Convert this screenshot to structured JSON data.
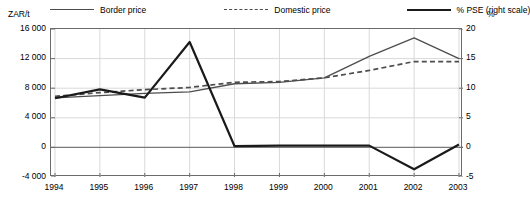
{
  "chart_data": {
    "type": "line",
    "title": "",
    "xlabel": "",
    "ylabel": "ZAR/t",
    "ylabel_right": "%",
    "x": [
      "1994",
      "1995",
      "1996",
      "1997",
      "1998",
      "1999",
      "2000",
      "2001",
      "2002",
      "2003"
    ],
    "categories": [
      "1994",
      "1995",
      "1996",
      "1997",
      "1998",
      "1999",
      "2000",
      "2001",
      "2002",
      "2003"
    ],
    "ylim": [
      -4000,
      16000
    ],
    "ylim_right": [
      -5,
      20
    ],
    "yticks": [
      "16 000",
      "12 000",
      "8 000",
      "4 000",
      "0",
      "-4 000"
    ],
    "ytick_values": [
      16000,
      12000,
      8000,
      4000,
      0,
      -4000
    ],
    "yticks_right": [
      "20",
      "15",
      "10",
      "5",
      "0",
      "-5"
    ],
    "ytick_values_right": [
      20,
      15,
      10,
      5,
      0,
      -5
    ],
    "grid": true,
    "legend_position": "top",
    "series": [
      {
        "name": "Border price",
        "axis": "left",
        "style": "solid-thin",
        "color": "#4d4d4d",
        "values": [
          6700,
          7000,
          7300,
          7500,
          8600,
          8800,
          9400,
          12300,
          14800,
          12000
        ]
      },
      {
        "name": "Domestic price",
        "axis": "left",
        "style": "dashed",
        "color": "#4d4d4d",
        "values": [
          6900,
          7400,
          7800,
          8100,
          8800,
          8900,
          9400,
          10400,
          11600,
          11600
        ]
      },
      {
        "name": "% PSE (right scale)",
        "axis": "right",
        "style": "solid-thick",
        "color": "#1a1a1a",
        "values": [
          8.3,
          9.8,
          8.4,
          17.8,
          0.2,
          0.3,
          0.3,
          0.3,
          -3.7,
          0.5
        ]
      }
    ]
  },
  "legend": {
    "items": [
      {
        "label": "Border price",
        "swatch": "solid-thin-line-icon"
      },
      {
        "label": "Domestic price",
        "swatch": "dashed-line-icon"
      },
      {
        "label": "% PSE (right scale)",
        "swatch": "solid-thick-line-icon"
      }
    ]
  },
  "axes": {
    "left_unit": "ZAR/t",
    "right_unit": "%"
  },
  "colors": {
    "border_price": "#4d4d4d",
    "domestic_price": "#4d4d4d",
    "pse": "#1a1a1a",
    "grid": "#d9d9d9",
    "frame": "#6b6b6b",
    "zero_line": "#7a7a7a",
    "background": "#ffffff"
  }
}
